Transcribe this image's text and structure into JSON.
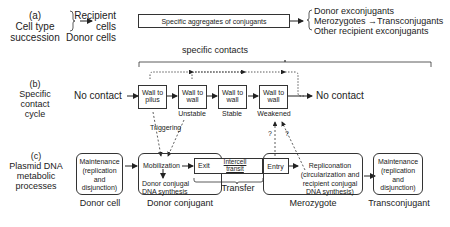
{
  "row_a": {
    "label": [
      "(a)",
      "Cell type",
      "succession"
    ],
    "inputs": [
      "Recipient",
      "cells",
      "Donor cells"
    ],
    "aggregate_box": "Specific aggregates of conjugants",
    "outputs": [
      "Donor exconjugants",
      "Merozygotes →Transconjugants",
      "Other recipient exconjugants"
    ]
  },
  "row_b": {
    "label": [
      "(b)",
      "Specific",
      "contact",
      "cycle"
    ],
    "bracket_label": "specific contacts",
    "start": "No contact",
    "end": "No contact",
    "boxes": [
      {
        "line1": "Wall to",
        "line2": "pilus",
        "caption": ""
      },
      {
        "line1": "Wall to",
        "line2": "wall",
        "caption": "Unstable"
      },
      {
        "line1": "Wall to",
        "line2": "wall",
        "caption": "Stable"
      },
      {
        "line1": "Wall to",
        "line2": "wall",
        "caption": "Weakened"
      }
    ],
    "triggering_label": "Triggering",
    "question_marks": [
      "?",
      "?"
    ]
  },
  "row_c": {
    "label": [
      "(c)",
      "Plasmid DNA",
      "metabolic",
      "processes"
    ],
    "donor_cell": {
      "box": [
        "Maintenance",
        "(replication",
        "and",
        "disjunction)"
      ],
      "caption": "Donor cell"
    },
    "donor_conjugant": {
      "mobilization": "Mobilization",
      "synthesis": [
        "Donor conjugal",
        "DNA synthesis"
      ],
      "caption": "Donor conjugant"
    },
    "transfer": {
      "exit": "Exit",
      "intercell": [
        "Intercell",
        "transit"
      ],
      "entry": "Entry",
      "caption": "Transfer"
    },
    "merozygote": {
      "replicon": [
        "Repliconation",
        "(circularization and",
        "recipient conjugal",
        "DNA synthesis)"
      ],
      "caption": "Merozygote"
    },
    "transconjugant": {
      "box": [
        "Maintenance",
        "(replication",
        "and",
        "disjunction)"
      ],
      "caption": "Transconjugant"
    }
  }
}
